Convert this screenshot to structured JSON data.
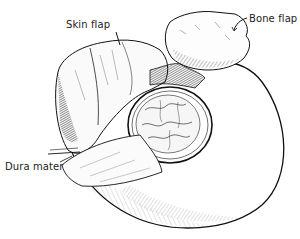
{
  "figure": {
    "labels": {
      "skin_flap": "Skin flap",
      "bone_flap": "Bone flap",
      "dura_mater": "Dura mater"
    }
  }
}
